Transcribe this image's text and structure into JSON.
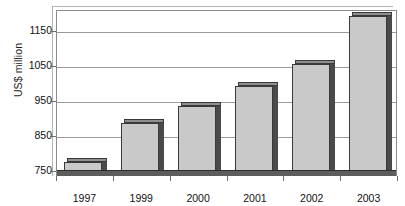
{
  "chart_data": {
    "type": "bar",
    "title": "",
    "xlabel": "",
    "ylabel": "US$ million",
    "categories": [
      "1997",
      "1999",
      "2000",
      "2001",
      "2002",
      "2003"
    ],
    "values": [
      780,
      890,
      938,
      995,
      1060,
      1195
    ],
    "ylim": [
      750,
      1210
    ],
    "yticks": [
      750,
      850,
      950,
      1050,
      1150
    ],
    "ytick_labels": [
      "750",
      "850",
      "950",
      "1050",
      "1150"
    ],
    "grid": true,
    "legend": false,
    "legend_position": "none",
    "series": [
      {
        "name": "US$ million",
        "values": [
          780,
          890,
          938,
          995,
          1060,
          1195
        ]
      }
    ],
    "colors": {
      "bar_fill": "#c9c9c9",
      "bar_edge": "#3a3a3a",
      "bar_shadow": "#4a4a4a",
      "gridline": "#9a9a9a",
      "frame": "#8b8b8b",
      "text": "#111111",
      "background": "#ffffff"
    },
    "style": "3d-bar"
  }
}
